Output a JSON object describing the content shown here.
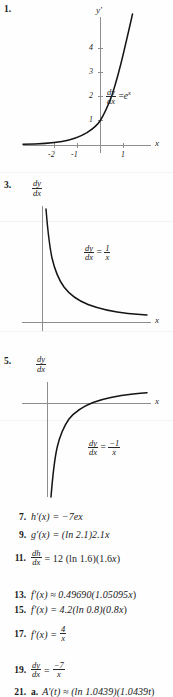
{
  "page": {
    "background": "#fefefe",
    "ink": "#1a1a1a",
    "axis_color": "#8d8d8d",
    "curve_color": "#141414"
  },
  "graphs": [
    {
      "number": "1.",
      "y_axis_label": "y′",
      "x_axis_label": "x",
      "equation": {
        "lhs_num": "dy",
        "lhs_den": "dx",
        "rel": "=",
        "rhs": "e",
        "rhs_sup": "x"
      },
      "equation_text": "dy/dx = e^x",
      "y_ticks": [
        "4",
        "3",
        "2",
        "1"
      ],
      "x_ticks": [
        "-2",
        "-1",
        "1"
      ],
      "curve_type": "exponential",
      "curve_desc": "y = e^x increasing exponential through (0,1)"
    },
    {
      "number": "3.",
      "y_axis_label": "dy/dx",
      "y_axis_label_num": "dy",
      "y_axis_label_den": "dx",
      "x_axis_label": "x",
      "equation": {
        "lhs_num": "dy",
        "lhs_den": "dx",
        "rel": "=",
        "rhs_num": "1",
        "rhs_den": "x"
      },
      "equation_text": "dy/dx = 1/x",
      "y_ticks": [],
      "x_ticks": [],
      "curve_type": "reciprocal-positive",
      "curve_desc": "y = 1/x decreasing hyperbola branch in first quadrant"
    },
    {
      "number": "5.",
      "y_axis_label": "dy/dx",
      "y_axis_label_num": "dy",
      "y_axis_label_den": "dx",
      "x_axis_label": "x",
      "equation": {
        "lhs_num": "dy",
        "lhs_den": "dx",
        "rel": "=",
        "rhs_num": "−1",
        "rhs_den": "x"
      },
      "equation_text": "dy/dx = -1/x",
      "y_ticks": [],
      "x_ticks": [],
      "curve_type": "reciprocal-negative",
      "curve_desc": "y = -1/x increasing toward zero from below in fourth quadrant"
    }
  ],
  "answers": [
    {
      "number": "7.",
      "text": "h′(x) = −7e",
      "sup": "x"
    },
    {
      "number": "9.",
      "text": "g′(x) = (ln 2.1)2.1",
      "sup": "x"
    },
    {
      "number": "11.",
      "type": "frac",
      "lhs_num": "dh",
      "lhs_den": "dx",
      "text": "= 12 (ln 1.6)(1.6",
      "sup": "x",
      "tail": ")"
    },
    {
      "number": "13.",
      "text": "f′(x) ≈ 0.49690(1.05095",
      "sup": "x",
      "tail": ")"
    },
    {
      "number": "15.",
      "text": "f′(x) = 4.2(ln 0.8)(0.8",
      "sup": "x",
      "tail": ")"
    },
    {
      "number": "17.",
      "type": "rhsfrac",
      "text": "f′(x) =",
      "rhs_num": "4",
      "rhs_den": "x"
    },
    {
      "number": "19.",
      "type": "bothfrac",
      "lhs_num": "dy",
      "lhs_den": "dx",
      "rel": "=",
      "rhs_num": "−7",
      "rhs_den": "x"
    },
    {
      "number": "21.",
      "label": "a.",
      "text": "A′(t) ≈ (ln 1.0439)(1.0439",
      "sup": "t",
      "tail": ")"
    }
  ]
}
